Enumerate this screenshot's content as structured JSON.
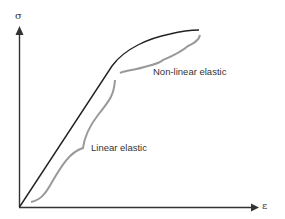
{
  "diagram": {
    "type": "stress-strain curve",
    "y_axis_label": "σ",
    "x_axis_label": "ε",
    "regions": [
      {
        "label": "Linear elastic"
      },
      {
        "label": "Non-linear elastic"
      }
    ],
    "colors": {
      "curve": "#222222",
      "brace": "#999999",
      "axis": "#333333"
    }
  }
}
